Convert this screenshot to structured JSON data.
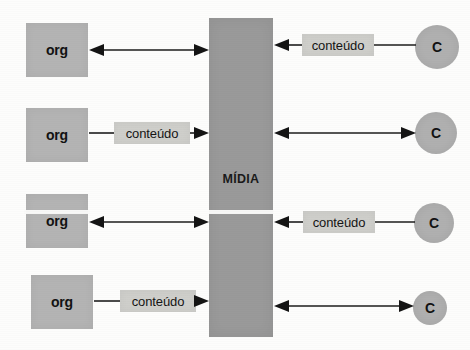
{
  "diagram": {
    "title": "MÍDIA",
    "center_column": {
      "label": "MÍDIA",
      "color": "#9a9a9a",
      "x": 209,
      "y": 18,
      "width": 64,
      "height": 319
    },
    "org_nodes": [
      {
        "label": "org",
        "x": 26,
        "y": 23,
        "width": 62,
        "height": 54
      },
      {
        "label": "org",
        "x": 26,
        "y": 108,
        "width": 62,
        "height": 54
      },
      {
        "label": "org",
        "x": 26,
        "y": 194,
        "width": 62,
        "height": 54
      },
      {
        "label": "org",
        "x": 31,
        "y": 275,
        "width": 62,
        "height": 54
      }
    ],
    "consumer_nodes": [
      {
        "label": "C",
        "cx": 437,
        "cy": 47,
        "r": 22
      },
      {
        "label": "C",
        "cx": 436,
        "cy": 133,
        "r": 21
      },
      {
        "label": "C",
        "cx": 434,
        "cy": 223,
        "r": 20
      },
      {
        "label": "C",
        "cx": 430,
        "cy": 308,
        "r": 17
      }
    ],
    "content_pills": [
      {
        "label": "conteúdo",
        "x": 302,
        "y": 34,
        "width": 72,
        "height": 22,
        "side": "right",
        "row": 1
      },
      {
        "label": "conteúdo",
        "x": 114,
        "y": 122,
        "width": 76,
        "height": 22,
        "side": "left",
        "row": 2
      },
      {
        "label": "conteúdo",
        "x": 303,
        "y": 211,
        "width": 72,
        "height": 22,
        "side": "right",
        "row": 3
      },
      {
        "label": "conteúdo",
        "x": 120,
        "y": 290,
        "width": 76,
        "height": 22,
        "side": "left",
        "row": 4
      }
    ],
    "connectors": [
      {
        "name": "org1-to-media",
        "from": "org",
        "to": "media",
        "arrow": "both",
        "y": 50,
        "x1": 90,
        "x2": 207
      },
      {
        "name": "org2-to-pill",
        "from": "org",
        "to": "pill",
        "arrow": "none",
        "y": 133,
        "x1": 90,
        "x2": 114
      },
      {
        "name": "pill2-to-media",
        "from": "pill",
        "to": "media",
        "arrow": "end",
        "y": 133,
        "x1": 190,
        "x2": 207
      },
      {
        "name": "org3-to-media",
        "from": "org",
        "to": "media",
        "arrow": "both",
        "y": 222,
        "x1": 90,
        "x2": 207
      },
      {
        "name": "org4-to-pill",
        "from": "org",
        "to": "pill",
        "arrow": "none",
        "y": 301,
        "x1": 95,
        "x2": 120
      },
      {
        "name": "pill4-to-media",
        "from": "pill",
        "to": "media",
        "arrow": "end",
        "y": 301,
        "x1": 196,
        "x2": 207
      },
      {
        "name": "media-to-pill1",
        "from": "media",
        "to": "pill",
        "arrow": "start",
        "y": 45,
        "x1": 275,
        "x2": 302
      },
      {
        "name": "pill1-to-c1",
        "from": "pill",
        "to": "consumer",
        "arrow": "none",
        "y": 45,
        "x1": 374,
        "x2": 415
      },
      {
        "name": "media-to-c2",
        "from": "media",
        "to": "consumer",
        "arrow": "both",
        "y": 133,
        "x1": 275,
        "x2": 415
      },
      {
        "name": "media-to-pill3",
        "from": "media",
        "to": "pill",
        "arrow": "start",
        "y": 222,
        "x1": 275,
        "x2": 303
      },
      {
        "name": "pill3-to-c3",
        "from": "pill",
        "to": "consumer",
        "arrow": "none",
        "y": 222,
        "x1": 375,
        "x2": 414
      },
      {
        "name": "media-to-c4",
        "from": "media",
        "to": "consumer",
        "arrow": "both",
        "y": 306,
        "x1": 275,
        "x2": 413
      }
    ],
    "colors": {
      "org_fill": "#b4b4b4",
      "media_fill": "#9a9a9a",
      "consumer_fill": "#b0b0b0",
      "pill_fill": "#cfcfcb",
      "line": "#1d1d1d",
      "background": "#fdfdfc"
    }
  }
}
